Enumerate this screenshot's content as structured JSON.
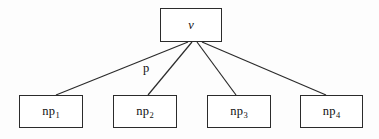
{
  "figure": {
    "type": "tree-diagram",
    "background_color": "#fdfdfd",
    "stroke_color": "#2b2b2b",
    "text_color": "#111111",
    "width": 379,
    "height": 139
  },
  "root": {
    "id": "v",
    "label": "v",
    "box": {
      "x": 160,
      "y": 8,
      "w": 62,
      "h": 34
    }
  },
  "leaves": [
    {
      "id": "np1",
      "base": "np",
      "sub": "1",
      "box": {
        "x": 19,
        "y": 95,
        "w": 64,
        "h": 33
      }
    },
    {
      "id": "np2",
      "base": "np",
      "sub": "2",
      "box": {
        "x": 113,
        "y": 95,
        "w": 64,
        "h": 33
      }
    },
    {
      "id": "np3",
      "base": "np",
      "sub": "3",
      "box": {
        "x": 207,
        "y": 95,
        "w": 64,
        "h": 33
      }
    },
    {
      "id": "np4",
      "base": "np",
      "sub": "4",
      "box": {
        "x": 300,
        "y": 95,
        "w": 63,
        "h": 33
      }
    }
  ],
  "edges": [
    {
      "from": "v",
      "to": "np1",
      "x1": 188,
      "y1": 42,
      "x2": 56,
      "y2": 95,
      "label": ""
    },
    {
      "from": "v",
      "to": "np2",
      "x1": 192,
      "y1": 42,
      "x2": 148,
      "y2": 95,
      "label": "p"
    },
    {
      "from": "v",
      "to": "np3",
      "x1": 197,
      "y1": 42,
      "x2": 236,
      "y2": 95,
      "label": ""
    },
    {
      "from": "v",
      "to": "np4",
      "x1": 202,
      "y1": 42,
      "x2": 326,
      "y2": 95,
      "label": ""
    }
  ],
  "edge_labels": [
    {
      "text": "p",
      "x": 143,
      "y": 62,
      "for_edge": "v-np2"
    }
  ]
}
